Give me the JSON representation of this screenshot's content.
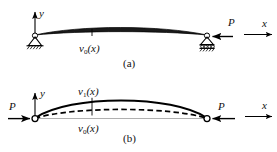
{
  "figure": {
    "title_a": "(a)",
    "title_b": "(b)",
    "panels": [
      {
        "id": "a",
        "caption": "(a)",
        "axis_y": "y",
        "axis_x": "x",
        "load_label": "P",
        "curve_labels": [
          {
            "name": "v",
            "subscript": "0",
            "arg": "(x)"
          }
        ],
        "supports": [
          "pin-support",
          "roller-support"
        ],
        "description": "Initially curved beam-column on pin and roller supports with axial load P applied at right"
      },
      {
        "id": "b",
        "caption": "(b)",
        "axis_y": "y",
        "axis_x": "x",
        "load_label_left": "P",
        "load_label_right": "P",
        "curve_labels": [
          {
            "name": "v",
            "subscript": "1",
            "arg": "(x)"
          },
          {
            "name": "v",
            "subscript": "0",
            "arg": "(x)"
          }
        ],
        "supports": [
          "pin-hollow",
          "pin-hollow"
        ],
        "description": "Deflected beam-column under axial compression P at both ends; solid curve v1(x) above dashed initial curve v0(x)"
      }
    ],
    "colors": {
      "line": "#000000",
      "background": "#ffffff",
      "fill": "#1a1a1a"
    }
  }
}
